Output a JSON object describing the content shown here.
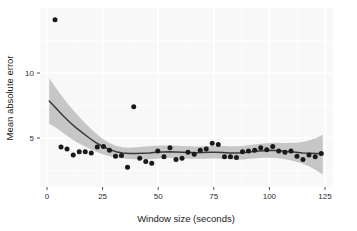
{
  "chart_data": {
    "type": "scatter",
    "title": "",
    "xlabel": "Window size (seconds)",
    "ylabel": "Mean absolute error",
    "xlim": [
      -2,
      129
    ],
    "ylim": [
      1.6,
      14.4
    ],
    "xticks": [
      0,
      25,
      50,
      75,
      100,
      125
    ],
    "xtick_labels": [
      "0",
      "25",
      "50",
      "75",
      "100",
      "125"
    ],
    "yticks": [
      5,
      10
    ],
    "ytick_labels": [
      "5",
      "10"
    ],
    "grid": true,
    "grid_color": "#ffffff",
    "panel_background": "#f2f2f2",
    "legend": null,
    "point_color": "#1a1a1a",
    "line_color": "#3a3a3a",
    "band_color": "#b3b3b3",
    "series": [
      {
        "name": "Mean absolute error",
        "type": "scatter",
        "points": [
          [
            3.6,
            14.1
          ],
          [
            6.3,
            4.3
          ],
          [
            9.0,
            4.15
          ],
          [
            11.8,
            3.7
          ],
          [
            14.5,
            3.95
          ],
          [
            17.2,
            3.95
          ],
          [
            19.9,
            3.85
          ],
          [
            22.6,
            4.3
          ],
          [
            25.4,
            4.35
          ],
          [
            28.1,
            4.05
          ],
          [
            30.8,
            3.6
          ],
          [
            33.5,
            3.65
          ],
          [
            36.2,
            2.75
          ],
          [
            39.0,
            7.4
          ],
          [
            41.7,
            3.45
          ],
          [
            44.4,
            3.2
          ],
          [
            47.1,
            3.05
          ],
          [
            49.8,
            4.0
          ],
          [
            52.6,
            3.55
          ],
          [
            55.3,
            4.25
          ],
          [
            58.0,
            3.35
          ],
          [
            60.7,
            3.45
          ],
          [
            63.4,
            3.9
          ],
          [
            66.2,
            3.75
          ],
          [
            68.9,
            4.05
          ],
          [
            71.6,
            4.15
          ],
          [
            74.3,
            4.6
          ],
          [
            77.0,
            4.5
          ],
          [
            79.8,
            3.55
          ],
          [
            82.5,
            3.55
          ],
          [
            85.2,
            3.5
          ],
          [
            87.9,
            3.95
          ],
          [
            90.6,
            4.0
          ],
          [
            93.4,
            4.05
          ],
          [
            96.1,
            4.25
          ],
          [
            98.8,
            4.1
          ],
          [
            101.5,
            4.35
          ],
          [
            104.2,
            4.0
          ],
          [
            107.0,
            3.9
          ],
          [
            109.7,
            4.0
          ],
          [
            112.4,
            3.6
          ],
          [
            115.1,
            3.35
          ],
          [
            117.8,
            3.7
          ],
          [
            120.6,
            3.55
          ],
          [
            123.3,
            3.8
          ]
        ]
      },
      {
        "name": "loess smooth",
        "type": "line",
        "points": [
          [
            1.0,
            7.85
          ],
          [
            4.0,
            7.3
          ],
          [
            7.0,
            6.75
          ],
          [
            10.0,
            6.25
          ],
          [
            13.0,
            5.8
          ],
          [
            16.0,
            5.4
          ],
          [
            19.0,
            5.0
          ],
          [
            22.0,
            4.65
          ],
          [
            25.0,
            4.35
          ],
          [
            28.0,
            4.12
          ],
          [
            31.0,
            3.95
          ],
          [
            34.0,
            3.85
          ],
          [
            37.0,
            3.8
          ],
          [
            40.0,
            3.8
          ],
          [
            43.0,
            3.82
          ],
          [
            46.0,
            3.85
          ],
          [
            49.0,
            3.9
          ],
          [
            52.0,
            3.93
          ],
          [
            55.0,
            3.94
          ],
          [
            58.0,
            3.92
          ],
          [
            61.0,
            3.9
          ],
          [
            64.0,
            3.88
          ],
          [
            67.0,
            3.87
          ],
          [
            70.0,
            3.88
          ],
          [
            73.0,
            3.9
          ],
          [
            76.0,
            3.9
          ],
          [
            79.0,
            3.88
          ],
          [
            82.0,
            3.85
          ],
          [
            85.0,
            3.84
          ],
          [
            88.0,
            3.86
          ],
          [
            91.0,
            3.92
          ],
          [
            94.0,
            3.98
          ],
          [
            97.0,
            4.02
          ],
          [
            100.0,
            4.05
          ],
          [
            103.0,
            4.04
          ],
          [
            106.0,
            4.0
          ],
          [
            109.0,
            3.95
          ],
          [
            112.0,
            3.9
          ],
          [
            115.0,
            3.85
          ],
          [
            118.0,
            3.82
          ],
          [
            121.0,
            3.8
          ],
          [
            124.0,
            3.78
          ]
        ]
      },
      {
        "name": "confidence band upper",
        "type": "band-upper",
        "points": [
          [
            1.0,
            9.6
          ],
          [
            4.0,
            8.85
          ],
          [
            7.0,
            8.15
          ],
          [
            10.0,
            7.5
          ],
          [
            13.0,
            6.9
          ],
          [
            16.0,
            6.35
          ],
          [
            19.0,
            5.82
          ],
          [
            22.0,
            5.35
          ],
          [
            25.0,
            4.95
          ],
          [
            28.0,
            4.62
          ],
          [
            31.0,
            4.4
          ],
          [
            34.0,
            4.28
          ],
          [
            37.0,
            4.25
          ],
          [
            40.0,
            4.28
          ],
          [
            43.0,
            4.32
          ],
          [
            46.0,
            4.36
          ],
          [
            49.0,
            4.4
          ],
          [
            52.0,
            4.42
          ],
          [
            55.0,
            4.42
          ],
          [
            58.0,
            4.4
          ],
          [
            61.0,
            4.38
          ],
          [
            64.0,
            4.36
          ],
          [
            67.0,
            4.35
          ],
          [
            70.0,
            4.36
          ],
          [
            73.0,
            4.38
          ],
          [
            76.0,
            4.39
          ],
          [
            79.0,
            4.38
          ],
          [
            82.0,
            4.36
          ],
          [
            85.0,
            4.36
          ],
          [
            88.0,
            4.39
          ],
          [
            91.0,
            4.45
          ],
          [
            94.0,
            4.52
          ],
          [
            97.0,
            4.58
          ],
          [
            100.0,
            4.62
          ],
          [
            103.0,
            4.63
          ],
          [
            106.0,
            4.62
          ],
          [
            109.0,
            4.62
          ],
          [
            112.0,
            4.64
          ],
          [
            115.0,
            4.7
          ],
          [
            118.0,
            4.82
          ],
          [
            121.0,
            5.0
          ],
          [
            124.0,
            5.25
          ]
        ]
      },
      {
        "name": "confidence band lower",
        "type": "band-lower",
        "points": [
          [
            1.0,
            6.1
          ],
          [
            4.0,
            5.8
          ],
          [
            7.0,
            5.42
          ],
          [
            10.0,
            5.05
          ],
          [
            13.0,
            4.72
          ],
          [
            16.0,
            4.45
          ],
          [
            19.0,
            4.2
          ],
          [
            22.0,
            3.96
          ],
          [
            25.0,
            3.75
          ],
          [
            28.0,
            3.6
          ],
          [
            31.0,
            3.48
          ],
          [
            34.0,
            3.42
          ],
          [
            37.0,
            3.38
          ],
          [
            40.0,
            3.36
          ],
          [
            43.0,
            3.36
          ],
          [
            46.0,
            3.37
          ],
          [
            49.0,
            3.4
          ],
          [
            52.0,
            3.44
          ],
          [
            55.0,
            3.46
          ],
          [
            58.0,
            3.45
          ],
          [
            61.0,
            3.43
          ],
          [
            64.0,
            3.41
          ],
          [
            67.0,
            3.4
          ],
          [
            70.0,
            3.4
          ],
          [
            73.0,
            3.42
          ],
          [
            76.0,
            3.42
          ],
          [
            79.0,
            3.4
          ],
          [
            82.0,
            3.36
          ],
          [
            85.0,
            3.34
          ],
          [
            88.0,
            3.35
          ],
          [
            91.0,
            3.4
          ],
          [
            94.0,
            3.45
          ],
          [
            97.0,
            3.48
          ],
          [
            100.0,
            3.49
          ],
          [
            103.0,
            3.46
          ],
          [
            106.0,
            3.4
          ],
          [
            109.0,
            3.3
          ],
          [
            112.0,
            3.18
          ],
          [
            115.0,
            3.02
          ],
          [
            118.0,
            2.8
          ],
          [
            121.0,
            2.52
          ],
          [
            124.0,
            2.2
          ]
        ]
      }
    ]
  },
  "layout": {
    "panel": {
      "left": 40,
      "top": 8,
      "right": 333,
      "bottom": 187
    },
    "x_pixel_for_zero": 47,
    "x_pixels_per_unit": 2.224,
    "y_pixel_for_five": 138,
    "y_pixels_per_unit": 13.0
  }
}
